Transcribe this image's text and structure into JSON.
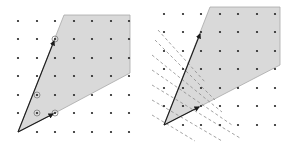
{
  "figure": {
    "colors": {
      "cone_fill": "#d9d9d9",
      "cone_edge": "#a8a8a8",
      "vector": "#1a1a1a",
      "dot": "#222222",
      "circle": "#888888",
      "dash": "#8a8a8a"
    },
    "left_panel": {
      "grid": {
        "origin": [
          18,
          132
        ],
        "step": 18.5,
        "cols": 7,
        "rows": 7
      },
      "cone_polygon": [
        [
          18,
          132
        ],
        [
          64,
          15
        ],
        [
          130,
          15
        ],
        [
          130,
          73
        ],
        [
          55,
          113
        ]
      ],
      "vectors": [
        {
          "name": "v1",
          "from": [
            18,
            132
          ],
          "to": [
            55,
            39
          ]
        },
        {
          "name": "v2",
          "from": [
            18,
            132
          ],
          "to": [
            55,
            113
          ]
        }
      ],
      "circled_points": [
        [
          55,
          39
        ],
        [
          37,
          95
        ],
        [
          37,
          113
        ],
        [
          55,
          113
        ]
      ]
    },
    "right_panel": {
      "grid": {
        "origin": [
          164,
          125
        ],
        "step": 18.5,
        "cols": 7,
        "rows": 7
      },
      "cone_polygon": [
        [
          164,
          125
        ],
        [
          210,
          7
        ],
        [
          280,
          7
        ],
        [
          280,
          65
        ],
        [
          201,
          106
        ]
      ],
      "vectors": [
        {
          "name": "v1",
          "from": [
            164,
            125
          ],
          "to": [
            201,
            32
          ]
        },
        {
          "name": "v2",
          "from": [
            164,
            125
          ],
          "to": [
            201,
            106
          ]
        }
      ],
      "dashed_lines_count": 7
    }
  }
}
